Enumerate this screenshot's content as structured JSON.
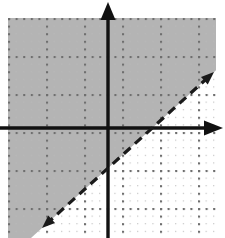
{
  "figure": {
    "width": 225,
    "height": 238,
    "background_color": "#ffffff"
  },
  "colors": {
    "axis": "#111111",
    "boundary_line": "#1a1a1a",
    "shading_fill": "#b4b4b4",
    "grid_dot": "#7d7d7d",
    "grid_dot_minor": "#b9b9b9",
    "plot_background": "#ffffff"
  },
  "plot_area": {
    "left": 8,
    "top": 18,
    "right": 216,
    "bottom": 238,
    "grid_spacing_px": 38,
    "minor_dot_spacing_px": 7.6,
    "grid_style": "dotted"
  },
  "axes": {
    "origin_px": {
      "x": 108,
      "y": 128
    },
    "x_axis": {
      "label": "x-axis",
      "orientation": "horizontal",
      "y_px": 128,
      "start_px": 0,
      "end_px": 223,
      "stroke_width": 3.4,
      "arrowheads": [
        "right"
      ]
    },
    "y_axis": {
      "label": "y-axis",
      "orientation": "vertical",
      "x_px": 108,
      "start_px": 2,
      "end_px": 238,
      "stroke_width": 3.4,
      "arrowheads": [
        "up"
      ]
    }
  },
  "boundary_line": {
    "label": "boundary line",
    "style": "dashed",
    "strict_inequality": true,
    "slope": 1,
    "y_intercept_units": -1,
    "x_intercept_units": 1,
    "dash_pattern": "9 6",
    "stroke_width": 3.2,
    "arrowheads": [
      "upper-right",
      "lower-left"
    ],
    "endpoints_px": {
      "lower_left": {
        "x": 42,
        "y": 228
      },
      "upper_right": {
        "x": 214,
        "y": 72
      }
    }
  },
  "shaded_region": {
    "label": "solution region",
    "position": "above-left of boundary line",
    "fill": "#b4b4b4",
    "description": "Region above the dashed line is shaded gray"
  },
  "chart_data": {
    "type": "line",
    "xlabel": "x",
    "ylabel": "y",
    "xlim": [
      -2.8,
      3.0
    ],
    "ylim": [
      -2.9,
      2.9
    ],
    "grid": true,
    "legend": null,
    "series": [
      {
        "name": "boundary line y = x - 1",
        "style": "dashed",
        "x": [
          -2.8,
          3.0
        ],
        "y": [
          -3.8,
          2.0
        ]
      }
    ],
    "annotations": [
      {
        "type": "shaded_halfplane",
        "relation": "y > x - 1",
        "side": "above",
        "boundary_included": false
      }
    ]
  }
}
